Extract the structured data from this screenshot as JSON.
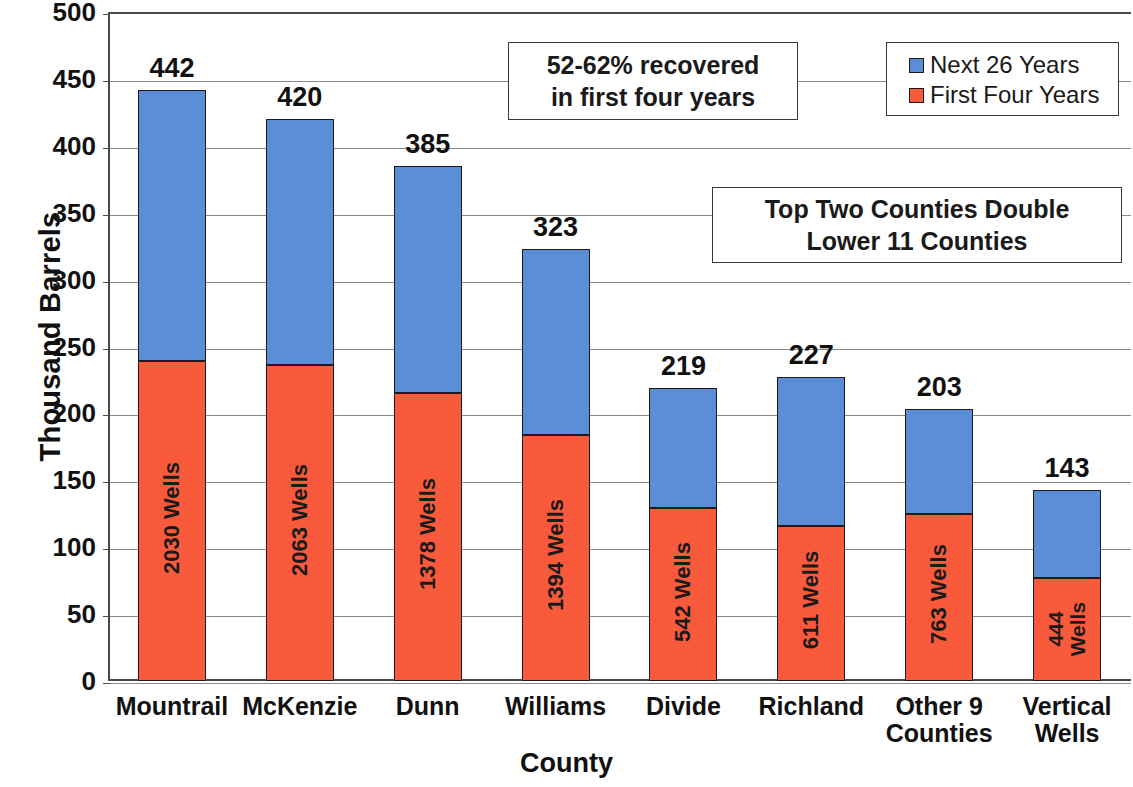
{
  "chart_data": {
    "type": "bar",
    "subtype": "stacked",
    "title": "",
    "xlabel": "County",
    "ylabel": "Thousand Barrels",
    "ylim": [
      0,
      500
    ],
    "ytick_step": 50,
    "yticks": [
      500,
      450,
      400,
      350,
      300,
      250,
      200,
      150,
      100,
      50,
      0
    ],
    "grid": true,
    "legend_position": "top-right",
    "categories": [
      "Mountrail",
      "McKenzie",
      "Dunn",
      "Williams",
      "Divide",
      "Richland",
      "Other 9 Counties",
      "Vertical Wells"
    ],
    "category_lines": [
      [
        "Mountrail"
      ],
      [
        "McKenzie"
      ],
      [
        "Dunn"
      ],
      [
        "Williams"
      ],
      [
        "Divide"
      ],
      [
        "Richland"
      ],
      [
        "Other 9",
        "Counties"
      ],
      [
        "Vertical",
        "Wells"
      ]
    ],
    "series": [
      {
        "name": "First Four Years",
        "color": "#fa5a3c",
        "values": [
          239,
          236,
          215,
          184,
          129,
          116,
          125,
          77
        ]
      },
      {
        "name": "Next 26 Years",
        "color": "#5b8ed6",
        "values": [
          203,
          184,
          170,
          139,
          90,
          111,
          78,
          66
        ]
      }
    ],
    "totals": [
      442,
      420,
      385,
      323,
      219,
      227,
      203,
      143
    ],
    "total_labels": [
      "442",
      "420",
      "385",
      "323",
      "219",
      "227",
      "203",
      "143"
    ],
    "bar_inner_labels": [
      "2030 Wells",
      "2063 Wells",
      "1378 Wells",
      "1394 Wells",
      "542 Wells",
      "611 Wells",
      "763 Wells",
      "444 Wells"
    ],
    "well_counts": [
      2030,
      2063,
      1378,
      1394,
      542,
      611,
      763,
      444
    ],
    "annotations": [
      {
        "id": "recovery",
        "lines": [
          "52-62% recovered",
          "in first four years"
        ]
      },
      {
        "id": "top-counties",
        "lines": [
          "Top Two Counties Double",
          "Lower 11 Counties"
        ]
      }
    ]
  },
  "legend": {
    "items": [
      {
        "label": "Next 26 Years",
        "color": "#5b8ed6"
      },
      {
        "label": "First Four Years",
        "color": "#fa5a3c"
      }
    ]
  }
}
